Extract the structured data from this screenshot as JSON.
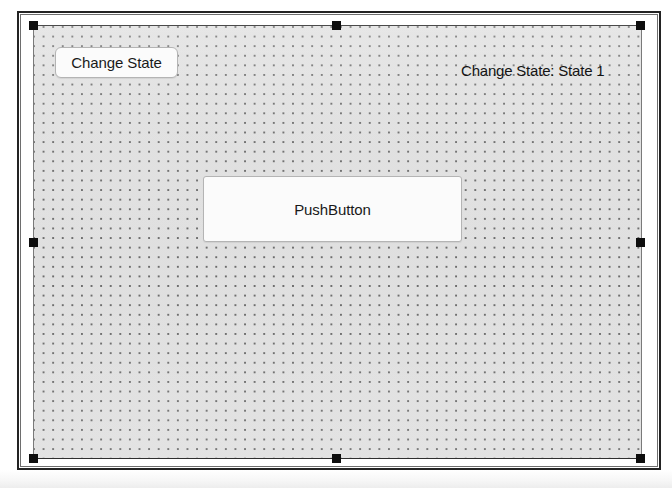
{
  "window": {
    "kind": "gui-form-designer-canvas",
    "selected": true
  },
  "form": {
    "grid_visible": true,
    "grid_spacing_px": 10,
    "background_color": "#d2d2d2",
    "selection_handle_color": "#0d0d0d"
  },
  "widgets": {
    "change_state_button": {
      "label": "Change State",
      "type": "push-button"
    },
    "push_button": {
      "label": "PushButton",
      "type": "push-button"
    },
    "state_label": {
      "text": "Change State: State 1",
      "type": "label"
    }
  },
  "handles": [
    {
      "name": "top-left"
    },
    {
      "name": "top-middle"
    },
    {
      "name": "top-right"
    },
    {
      "name": "middle-left"
    },
    {
      "name": "middle-right"
    },
    {
      "name": "bottom-left"
    },
    {
      "name": "bottom-middle"
    },
    {
      "name": "bottom-right"
    }
  ]
}
